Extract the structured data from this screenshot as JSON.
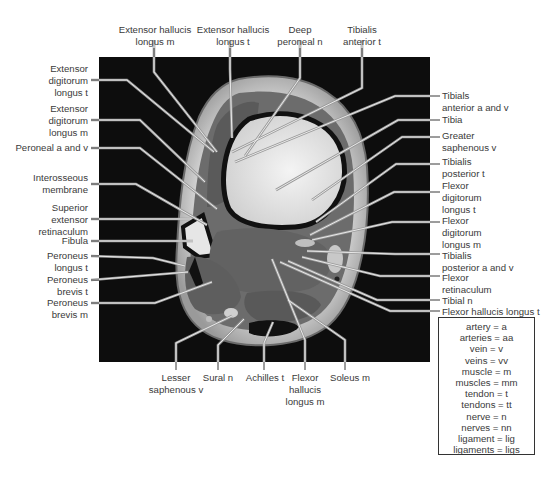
{
  "figure": {
    "colors": {
      "background": "#ffffff",
      "mri_background": "#0d0d0d",
      "label_text": "#3a3a3a",
      "leader_line": "#888888"
    }
  },
  "labels": {
    "top": [
      {
        "id": "ehl-m",
        "text": [
          "Extensor hallucis",
          "longus m"
        ]
      },
      {
        "id": "ehl-t",
        "text": [
          "Extensor hallucis",
          "longus t"
        ]
      },
      {
        "id": "deep-peroneal-n",
        "text": [
          "Deep",
          "peroneal n"
        ]
      },
      {
        "id": "tibialis-anterior-t",
        "text": [
          "Tibialis",
          "anterior t"
        ]
      }
    ],
    "left": [
      {
        "id": "edl-t",
        "text": [
          "Extensor",
          "digitorum",
          "longus t"
        ]
      },
      {
        "id": "edl-m",
        "text": [
          "Extensor",
          "digitorum",
          "longus m"
        ]
      },
      {
        "id": "peroneal-a-v",
        "text": [
          "Peroneal a and v"
        ]
      },
      {
        "id": "interosseous-membrane",
        "text": [
          "Interosseous",
          "membrane"
        ]
      },
      {
        "id": "superior-extensor-retinaculum",
        "text": [
          "Superior",
          "extensor",
          "retinaculum"
        ]
      },
      {
        "id": "fibula",
        "text": [
          "Fibula"
        ]
      },
      {
        "id": "peroneus-longus-t",
        "text": [
          "Peroneus",
          "longus t"
        ]
      },
      {
        "id": "peroneus-brevis-t",
        "text": [
          "Peroneus",
          "brevis t"
        ]
      },
      {
        "id": "peroneus-brevis-m",
        "text": [
          "Peroneus",
          "brevis m"
        ]
      }
    ],
    "right": [
      {
        "id": "tibialis-anterior-a-v",
        "text": [
          "Tibials",
          "anterior a and v"
        ]
      },
      {
        "id": "tibia",
        "text": [
          "Tibia"
        ]
      },
      {
        "id": "greater-saphenous-v",
        "text": [
          "Greater",
          "saphenous v"
        ]
      },
      {
        "id": "tibialis-posterior-t",
        "text": [
          "Tibialis",
          "posterior t"
        ]
      },
      {
        "id": "fdl-t",
        "text": [
          "Flexor",
          "digitorum",
          "longus t"
        ]
      },
      {
        "id": "fdl-m",
        "text": [
          "Flexor",
          "digitorum",
          "longus m"
        ]
      },
      {
        "id": "tibialis-posterior-a-v",
        "text": [
          "Tibialis",
          "posterior a and v"
        ]
      },
      {
        "id": "flexor-retinaculum",
        "text": [
          "Flexor",
          "retinaculum"
        ]
      },
      {
        "id": "tibial-n",
        "text": [
          "Tibial n"
        ]
      },
      {
        "id": "fhl-t",
        "text": [
          "Flexor hallucis longus t"
        ]
      }
    ],
    "bottom": [
      {
        "id": "lesser-saphenous-v",
        "text": [
          "Lesser",
          "saphenous v"
        ]
      },
      {
        "id": "sural-n",
        "text": [
          "Sural n"
        ]
      },
      {
        "id": "achilles-t",
        "text": [
          "Achilles t"
        ]
      },
      {
        "id": "fhl-m",
        "text": [
          "Flexor",
          "hallucis",
          "longus m"
        ]
      },
      {
        "id": "soleus-m",
        "text": [
          "Soleus m"
        ]
      }
    ]
  },
  "legend": {
    "rows": [
      "artery = a",
      "arteries = aa",
      "vein = v",
      "veins = vv",
      "muscle = m",
      "muscles = mm",
      "tendon = t",
      "tendons = tt",
      "nerve = n",
      "nerves = nn",
      "ligament = lig",
      "ligaments = ligs"
    ]
  }
}
